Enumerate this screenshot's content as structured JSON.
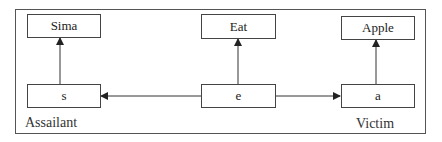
{
  "diagram": {
    "nodes": {
      "sima": "Sima",
      "eat": "Eat",
      "apple": "Apple",
      "s": "s",
      "e": "e",
      "a": "a"
    },
    "labels": {
      "assailant": "Assailant",
      "victim": "Victim"
    },
    "edges": [
      {
        "from": "s",
        "to": "Sima"
      },
      {
        "from": "e",
        "to": "Eat"
      },
      {
        "from": "a",
        "to": "Apple"
      },
      {
        "from": "e",
        "to": "s"
      },
      {
        "from": "e",
        "to": "a"
      }
    ]
  }
}
